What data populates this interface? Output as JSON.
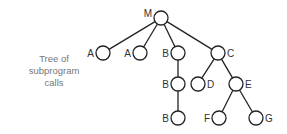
{
  "caption": {
    "lines": [
      "Tree of",
      "subprogram",
      "calls"
    ]
  },
  "colors": {
    "stroke": "#222222",
    "label": "#333333",
    "caption": "#777777"
  },
  "tree": {
    "nodes": [
      {
        "id": "M",
        "label": "M",
        "x": 161,
        "y": 18,
        "label_side": "left"
      },
      {
        "id": "A1",
        "label": "A",
        "x": 103,
        "y": 53,
        "label_side": "left"
      },
      {
        "id": "A2",
        "label": "A",
        "x": 140,
        "y": 53,
        "label_side": "left"
      },
      {
        "id": "B1",
        "label": "B",
        "x": 178,
        "y": 53,
        "label_side": "left"
      },
      {
        "id": "C",
        "label": "C",
        "x": 218,
        "y": 53,
        "label_side": "right"
      },
      {
        "id": "B2",
        "label": "B",
        "x": 178,
        "y": 84,
        "label_side": "left"
      },
      {
        "id": "D",
        "label": "D",
        "x": 198,
        "y": 84,
        "label_side": "right"
      },
      {
        "id": "E",
        "label": "E",
        "x": 236,
        "y": 84,
        "label_side": "right"
      },
      {
        "id": "B3",
        "label": "B",
        "x": 178,
        "y": 118,
        "label_side": "left"
      },
      {
        "id": "F",
        "label": "F",
        "x": 219,
        "y": 118,
        "label_side": "left"
      },
      {
        "id": "G",
        "label": "G",
        "x": 256,
        "y": 118,
        "label_side": "right"
      }
    ],
    "edges": [
      [
        "M",
        "A1"
      ],
      [
        "M",
        "A2"
      ],
      [
        "M",
        "B1"
      ],
      [
        "M",
        "C"
      ],
      [
        "B1",
        "B2"
      ],
      [
        "B2",
        "B3"
      ],
      [
        "C",
        "D"
      ],
      [
        "C",
        "E"
      ],
      [
        "E",
        "F"
      ],
      [
        "E",
        "G"
      ]
    ]
  }
}
